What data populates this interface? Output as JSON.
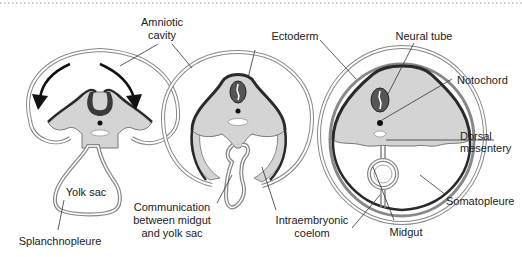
{
  "diagram": {
    "colors": {
      "ectoderm": "#2a2a2a",
      "mesoderm_fill": "#d4d4d4",
      "membrane": "#888888",
      "background": "#ffffff",
      "text": "#222222",
      "border_dots": "#999999"
    },
    "stages": [
      {
        "id": "stage-1",
        "description": "Early lateral folding with arrows indicating folding direction"
      },
      {
        "id": "stage-2",
        "description": "Midgut communicating with yolk sac"
      },
      {
        "id": "stage-3",
        "description": "Closed midgut suspended by dorsal mesentery"
      }
    ],
    "labels": {
      "amniotic_line1": "Amniotic",
      "amniotic_line2": "cavity",
      "yolk_sac": "Yolk sac",
      "splanchnopleure": "Splanchnopleure",
      "communication_line1": "Communication",
      "communication_line2": "between midgut",
      "communication_line3": "and yolk sac",
      "ectoderm": "Ectoderm",
      "intraembryonic_line1": "Intraembryonic",
      "intraembryonic_line2": "coelom",
      "neural_tube": "Neural tube",
      "notochord": "Notochord",
      "dorsal_line1": "Dorsal",
      "dorsal_line2": "mesentery",
      "somatopleure": "Somatopleure",
      "midgut": "Midgut"
    }
  }
}
